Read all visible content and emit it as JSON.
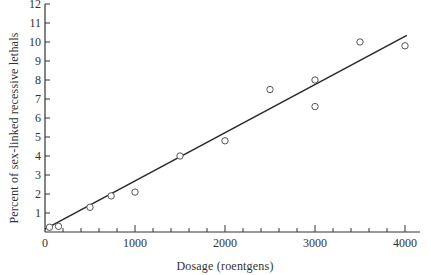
{
  "chart_data": {
    "type": "scatter",
    "title": "",
    "xlabel": "Dosage (roentgens)",
    "ylabel": "Percent of sex-linked recessive lethals",
    "xlim": [
      0,
      4150
    ],
    "ylim": [
      0,
      12
    ],
    "x_ticks": [
      0,
      1000,
      2000,
      3000,
      4000
    ],
    "x_tick_labels": [
      "0",
      "1000",
      "2000",
      "3000",
      "4000"
    ],
    "x_minor_tick_step": 200,
    "y_ticks": [
      1,
      2,
      3,
      4,
      5,
      6,
      7,
      8,
      9,
      10,
      11,
      12
    ],
    "y_tick_labels": [
      "1",
      "2",
      "3",
      "4",
      "5",
      "6",
      "7",
      "8",
      "9",
      "10",
      "11",
      "12"
    ],
    "grid": false,
    "legend": null,
    "series": [
      {
        "name": "Observed",
        "marker": "open-circle",
        "points": [
          {
            "x": 50,
            "y": 0.25
          },
          {
            "x": 150,
            "y": 0.3
          },
          {
            "x": 500,
            "y": 1.3
          },
          {
            "x": 735,
            "y": 1.9
          },
          {
            "x": 1000,
            "y": 2.1
          },
          {
            "x": 1500,
            "y": 4.0
          },
          {
            "x": 2000,
            "y": 4.8
          },
          {
            "x": 2500,
            "y": 7.5
          },
          {
            "x": 3000,
            "y": 8.0
          },
          {
            "x": 3000,
            "y": 6.6
          },
          {
            "x": 3500,
            "y": 10.0
          },
          {
            "x": 4000,
            "y": 9.8
          }
        ]
      },
      {
        "name": "Linear fit",
        "style": "line",
        "points": [
          {
            "x": 0,
            "y": 0.15
          },
          {
            "x": 4020,
            "y": 10.35
          }
        ]
      }
    ]
  },
  "colors": {
    "axis": "#333333",
    "marker": "#555555",
    "line": "#2a2a2a",
    "background": "#ffffff"
  }
}
